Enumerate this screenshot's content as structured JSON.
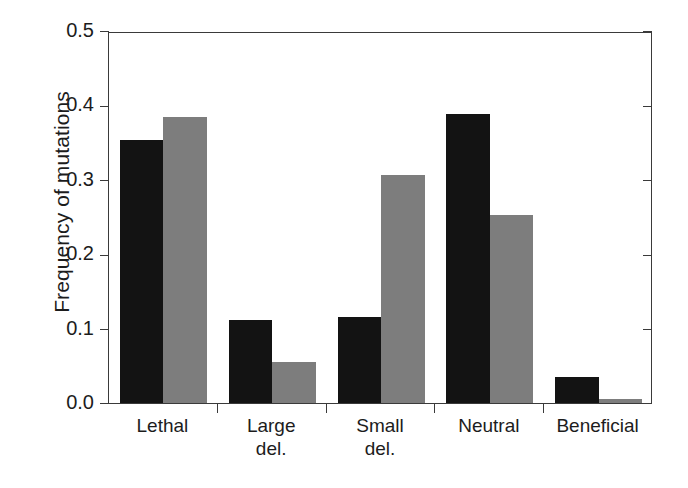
{
  "chart_data": {
    "type": "bar",
    "title": "",
    "xlabel": "",
    "ylabel": "Frequency of mutations",
    "ylim": [
      0.0,
      0.5
    ],
    "yticks": [
      "0.0",
      "0.1",
      "0.2",
      "0.3",
      "0.4",
      "0.5"
    ],
    "ytick_values": [
      0.0,
      0.1,
      0.2,
      0.3,
      0.4,
      0.5
    ],
    "grid": false,
    "legend": "none",
    "categories": [
      "Lethal",
      "Large del.",
      "Small del.",
      "Neutral",
      "Beneficial"
    ],
    "category_lines": [
      [
        "Lethal"
      ],
      [
        "Large",
        "del."
      ],
      [
        "Small",
        "del."
      ],
      [
        "Neutral"
      ],
      [
        "Beneficial"
      ]
    ],
    "series": [
      {
        "name": "series-1",
        "color": "#131313",
        "values": [
          0.353,
          0.112,
          0.116,
          0.389,
          0.035
        ]
      },
      {
        "name": "series-2",
        "color": "#7d7d7d",
        "values": [
          0.384,
          0.055,
          0.306,
          0.253,
          0.005
        ]
      }
    ]
  },
  "axes": {
    "frame_color": "#3a3a3a",
    "background": "#ffffff"
  }
}
